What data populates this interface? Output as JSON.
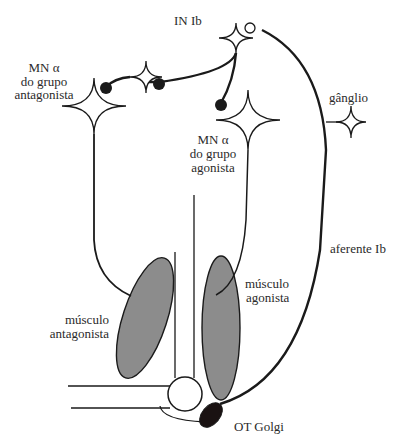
{
  "diagram": {
    "type": "neural-circuit",
    "colors": {
      "line": "#1a1a1a",
      "muscle_fill": "#8c8c8c",
      "golgi_fill": "#1a1212",
      "background": "#ffffff"
    },
    "labels": {
      "in_ib": "IN Ib",
      "mn_antagonist_line1": "MN α",
      "mn_antagonist_line2": "do grupo",
      "mn_antagonist_line3": "antagonista",
      "mn_agonist_line1": "MN α",
      "mn_agonist_line2": "do grupo",
      "mn_agonist_line3": "agonista",
      "ganglion": "gânglio",
      "afferent_ib": "aferente Ib",
      "muscle_agonist_line1": "músculo",
      "muscle_agonist_line2": "agonista",
      "muscle_antagonist_line1": "músculo",
      "muscle_antagonist_line2": "antagonista",
      "golgi": "OT Golgi"
    },
    "nodes": [
      {
        "id": "in-ib",
        "kind": "interneuron"
      },
      {
        "id": "mn-antagonist",
        "kind": "motor-neuron"
      },
      {
        "id": "mn-agonist",
        "kind": "motor-neuron"
      },
      {
        "id": "small-interneuron",
        "kind": "interneuron"
      },
      {
        "id": "ganglion",
        "kind": "ganglion-cell"
      },
      {
        "id": "golgi-tendon-organ",
        "kind": "receptor"
      },
      {
        "id": "muscle-agonist",
        "kind": "muscle"
      },
      {
        "id": "muscle-antagonist",
        "kind": "muscle"
      },
      {
        "id": "joint",
        "kind": "joint"
      }
    ]
  }
}
